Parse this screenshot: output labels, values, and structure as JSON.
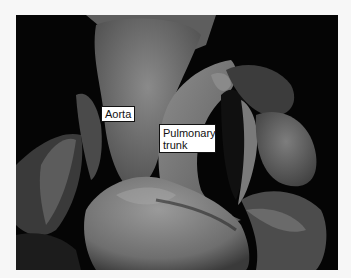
{
  "image": {
    "subject": "Anterior view of heart showing great vessels",
    "style": "grayscale photograph",
    "background_color": "#f7f7f7",
    "photo_background": "#050505"
  },
  "labels": {
    "aorta": "Aorta",
    "pulmonary_line1": "Pulmonary",
    "pulmonary_line2": "trunk"
  }
}
